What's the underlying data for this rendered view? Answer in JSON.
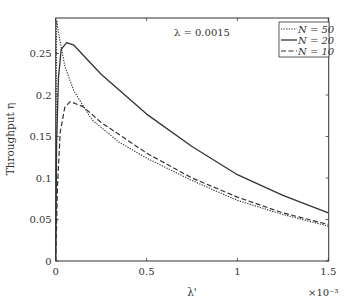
{
  "chart_data": {
    "type": "line",
    "title": "",
    "xlabel": "λ'",
    "ylabel": "Throughput η",
    "x_multiplier": "×10⁻³",
    "xlim": [
      0,
      1.5
    ],
    "ylim": [
      0,
      0.29
    ],
    "xticks": [
      0,
      0.5,
      1,
      1.5
    ],
    "xtick_labels": [
      "0",
      "0.5",
      "1",
      "1.5"
    ],
    "yticks": [
      0,
      0.05,
      0.1,
      0.15,
      0.2,
      0.25
    ],
    "ytick_labels": [
      "0",
      "0.05",
      "0.1",
      "0.15",
      "0.2",
      "0.25"
    ],
    "grid": false,
    "annotation": "λ = 0.0015",
    "legend_position": "upper right",
    "series": [
      {
        "name": "N = 50",
        "style": "dotted",
        "x": [
          0,
          0.005,
          0.02,
          0.05,
          0.1,
          0.2,
          0.35,
          0.5,
          0.75,
          1.0,
          1.25,
          1.5
        ],
        "values": [
          0,
          0.29,
          0.27,
          0.235,
          0.205,
          0.17,
          0.143,
          0.124,
          0.097,
          0.073,
          0.056,
          0.042
        ]
      },
      {
        "name": "N = 20",
        "style": "solid",
        "x": [
          0,
          0.005,
          0.015,
          0.03,
          0.06,
          0.1,
          0.25,
          0.5,
          0.75,
          1.0,
          1.25,
          1.5
        ],
        "values": [
          0,
          0.14,
          0.22,
          0.255,
          0.263,
          0.26,
          0.225,
          0.177,
          0.138,
          0.104,
          0.079,
          0.058
        ]
      },
      {
        "name": "N = 10",
        "style": "dashed",
        "x": [
          0,
          0.01,
          0.025,
          0.05,
          0.08,
          0.15,
          0.25,
          0.5,
          0.75,
          1.0,
          1.25,
          1.5
        ],
        "values": [
          0,
          0.09,
          0.155,
          0.185,
          0.192,
          0.186,
          0.167,
          0.13,
          0.1,
          0.077,
          0.058,
          0.044
        ]
      }
    ]
  }
}
